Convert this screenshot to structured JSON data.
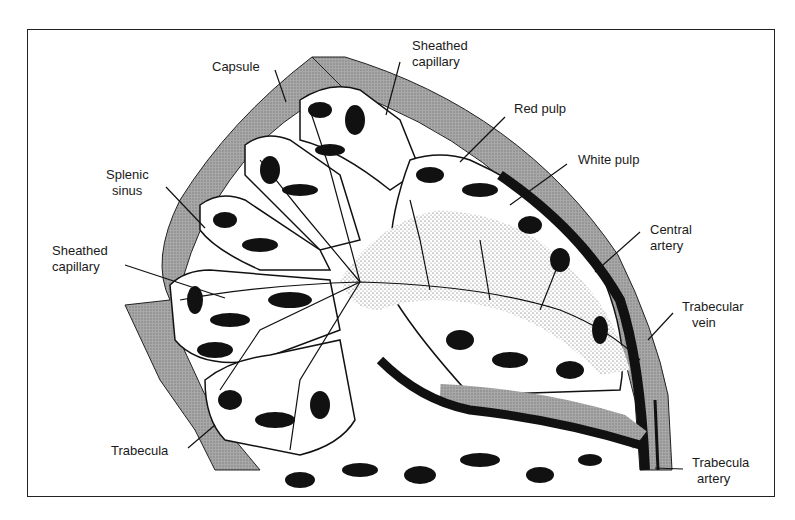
{
  "diagram": {
    "labels": [
      {
        "id": "capsule",
        "text": "Capsule"
      },
      {
        "id": "sheathed-capillary-top",
        "line1": "Sheathed",
        "line2": "capillary"
      },
      {
        "id": "red-pulp",
        "text": "Red pulp"
      },
      {
        "id": "white-pulp",
        "text": "White pulp"
      },
      {
        "id": "splenic-sinus",
        "line1": "Splenic",
        "line2": "sinus"
      },
      {
        "id": "central-artery",
        "line1": "Central",
        "line2": "artery"
      },
      {
        "id": "sheathed-capillary-left",
        "line1": "Sheathed",
        "line2": "capillary"
      },
      {
        "id": "trabecular-vein",
        "line1": "Trabecular",
        "line2": "vein"
      },
      {
        "id": "trabecula",
        "text": "Trabecula"
      },
      {
        "id": "trabecula-artery",
        "line1": "Trabecula",
        "line2": "artery"
      }
    ],
    "colors": {
      "ink": "#111111",
      "capsule_fill": "#9a9a9a",
      "background": "#ffffff",
      "white_pulp_stipple": "#555555"
    }
  }
}
